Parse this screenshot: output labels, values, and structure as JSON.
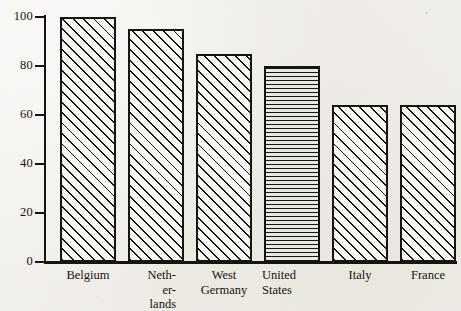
{
  "chart_data": {
    "type": "bar",
    "title": "",
    "subtitle": "",
    "xlabel": "",
    "ylabel": "",
    "categories": [
      "Belgium",
      "Netherlands",
      "West Germany",
      "United States",
      "Italy",
      "France"
    ],
    "category_label_lines": [
      [
        "Belgium"
      ],
      [
        "Neth-",
        "er-",
        "lands"
      ],
      [
        "West",
        "Germany"
      ],
      [
        "United",
        "States"
      ],
      [
        "Italy"
      ],
      [
        "France"
      ]
    ],
    "values": [
      100,
      95,
      85,
      80,
      64,
      64
    ],
    "ylim": [
      0,
      100
    ],
    "yticks": [
      0,
      20,
      40,
      60,
      80,
      100
    ],
    "ytick_labels": [
      "0",
      "20",
      "40",
      "60",
      "80",
      "100"
    ],
    "grid": false,
    "legend": null,
    "bar_fills": [
      "diagonal-hatch",
      "diagonal-hatch",
      "diagonal-hatch",
      "horizontal-hatch",
      "diagonal-hatch",
      "diagonal-hatch"
    ],
    "highlighted_category": "United States",
    "colors": {
      "ink": "#16140f",
      "paper": "#f2f0ec",
      "bar_fill": "#faf9f6",
      "highlight_fill": "#e9e7e2"
    }
  },
  "bars": [
    {
      "label": "Belgium",
      "value": 100,
      "fill": "diagonal-hatch",
      "x": 60,
      "width": 56,
      "label_align": "center",
      "label_x": 48,
      "label_width": 80
    },
    {
      "label": "Netherlands",
      "value": 95,
      "fill": "diagonal-hatch",
      "x": 128,
      "width": 56,
      "label_align": "right",
      "label_x": 110,
      "label_width": 66
    },
    {
      "label": "West Germany",
      "value": 85,
      "fill": "diagonal-hatch",
      "x": 196,
      "width": 56,
      "label_align": "center",
      "label_x": 184,
      "label_width": 80
    },
    {
      "label": "United States",
      "value": 80,
      "fill": "horizontal-hatch",
      "x": 264,
      "width": 56,
      "label_align": "left",
      "label_x": 262,
      "label_width": 80
    },
    {
      "label": "Italy",
      "value": 64,
      "fill": "diagonal-hatch",
      "x": 332,
      "width": 56,
      "label_align": "center",
      "label_x": 320,
      "label_width": 80
    },
    {
      "label": "France",
      "value": 64,
      "fill": "diagonal-hatch",
      "x": 400,
      "width": 56,
      "label_align": "center",
      "label_x": 386,
      "label_width": 84
    }
  ],
  "axis": {
    "ticks": [
      {
        "label": "100",
        "value": 100
      },
      {
        "label": "80",
        "value": 80
      },
      {
        "label": "60",
        "value": 60
      },
      {
        "label": "40",
        "value": 40
      },
      {
        "label": "20",
        "value": 20
      },
      {
        "label": "0",
        "value": 0
      }
    ]
  }
}
